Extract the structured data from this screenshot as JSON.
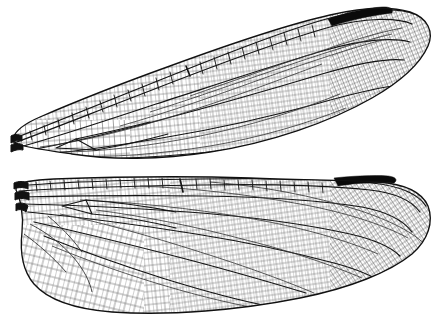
{
  "figure": {
    "domain_label": "dragonfly-wing-venation-plate",
    "background_color": "#ffffff",
    "ink_color": "#111111",
    "crossvein_color": "#555555",
    "pterostigma_color": "#0a0a0a",
    "caption": "",
    "width": 440,
    "height": 325
  },
  "wings": [
    {
      "id": "forewing",
      "name": "Forewing",
      "position": "upper",
      "orientation_note": "tilted, apex toward upper right, base at left",
      "base_x": 12,
      "apex_x": 432,
      "leading_edge_label": "costal margin",
      "trailing_edge_label": "anal margin",
      "pterostigma": {
        "label": "pterostigma",
        "x": 330,
        "y": 12,
        "length": 48,
        "thickness": 7,
        "color": "#0a0a0a"
      },
      "nodus": {
        "label": "nodus",
        "x": 186,
        "y": 72
      },
      "discoidal_cell": {
        "label": "discoidal triangle",
        "x": 66,
        "y": 140
      },
      "cell_density": "dense",
      "cell_size_px": 5
    },
    {
      "id": "hindwing",
      "name": "Hindwing",
      "position": "lower",
      "orientation_note": "broader, with expanded anal lobe at base",
      "base_x": 14,
      "apex_x": 430,
      "leading_edge_label": "costal margin",
      "trailing_edge_label": "anal margin",
      "pterostigma": {
        "label": "pterostigma",
        "x": 336,
        "y": 172,
        "length": 44,
        "thickness": 7,
        "color": "#0a0a0a"
      },
      "nodus": {
        "label": "nodus",
        "x": 180,
        "y": 190
      },
      "anal_lobe": {
        "label": "anal lobe",
        "x": 30,
        "y": 250
      },
      "discoidal_cell": {
        "label": "discoidal triangle",
        "x": 72,
        "y": 215
      },
      "cell_density": "dense",
      "cell_size_px": 5
    }
  ]
}
